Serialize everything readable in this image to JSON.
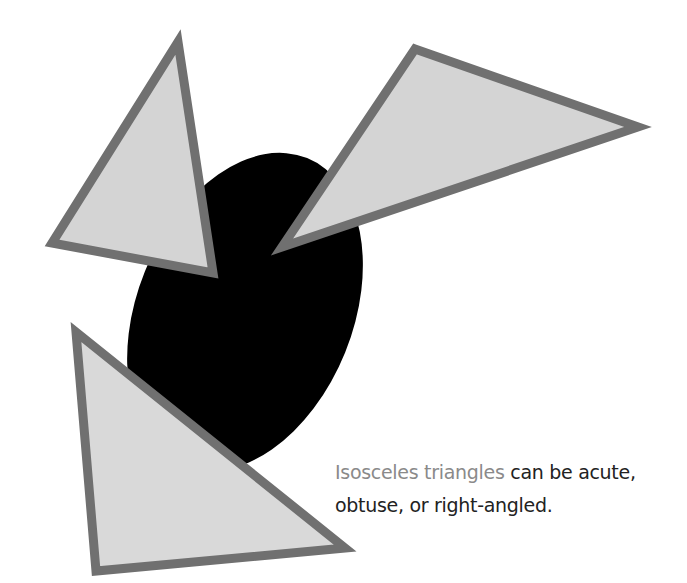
{
  "caption": {
    "highlight": "Isosceles triangles",
    "rest": " can be acute, obtuse, or right-angled."
  },
  "colors": {
    "background": "#ffffff",
    "ellipse": "#000000",
    "triangle_fill": "#d4d4d4",
    "triangle_stroke": "#707070",
    "caption_highlight": "#8a8a8a",
    "caption_text": "#222222"
  },
  "shapes": {
    "ellipse": {
      "cx": 245,
      "cy": 312,
      "rx": 108,
      "ry": 166,
      "rotate": 22
    },
    "triangles": [
      {
        "name": "acute",
        "points": "178,42 52,243 213,273"
      },
      {
        "name": "obtuse",
        "points": "415,49 638,127 282,247"
      },
      {
        "name": "right-angled",
        "points": "76,332 96,571 345,548"
      }
    ]
  }
}
